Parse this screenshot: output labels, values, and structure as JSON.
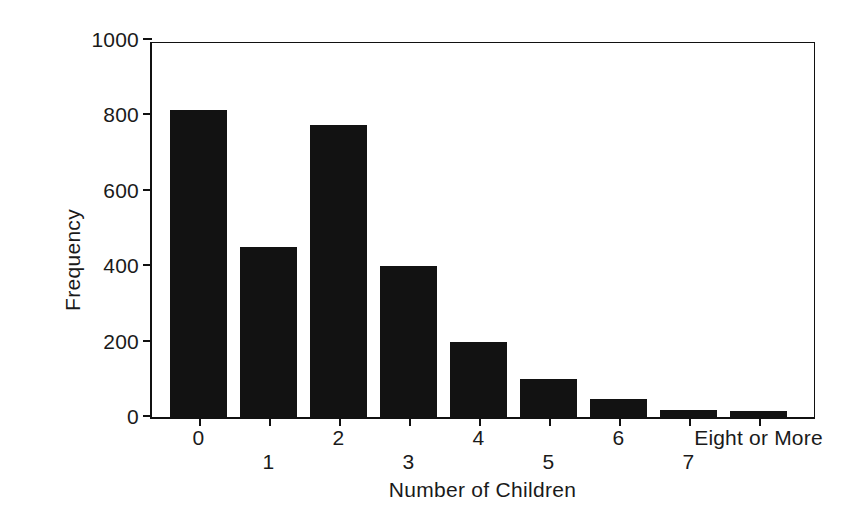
{
  "chart_data": {
    "type": "bar",
    "title": "",
    "xlabel": "Number of Children",
    "ylabel": "Frequency",
    "categories": [
      "0",
      "1",
      "2",
      "3",
      "4",
      "5",
      "6",
      "7",
      "Eight or More"
    ],
    "values": [
      815,
      450,
      775,
      400,
      200,
      100,
      48,
      18,
      15
    ],
    "ylim": [
      0,
      1000
    ],
    "yticks": [
      0,
      200,
      400,
      600,
      800,
      1000
    ],
    "ytick_labels": [
      "0",
      "200",
      "400",
      "600",
      "800",
      "1000"
    ],
    "grid": false,
    "legend": null,
    "bar_color": "#121212",
    "axis_color": "#111111",
    "background_color": "#ffffff",
    "xtick_label_rows": [
      "high",
      "low",
      "high",
      "low",
      "high",
      "low",
      "high",
      "low",
      "high"
    ]
  }
}
